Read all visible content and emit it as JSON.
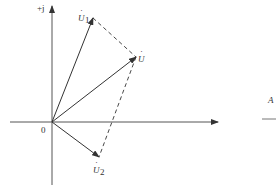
{
  "diagram": {
    "type": "phasor-diagram",
    "axis": {
      "imag_label": "+j",
      "origin_label": "0"
    },
    "phasors": [
      {
        "id": "U1",
        "label_base": "U",
        "label_sub": "1",
        "tip": [
          93,
          18
        ]
      },
      {
        "id": "U",
        "label_base": "U",
        "label_sub": "",
        "tip": [
          136,
          57
        ]
      },
      {
        "id": "U2",
        "label_base": "U",
        "label_sub": "2",
        "tip": [
          99,
          157
        ]
      }
    ],
    "parallelogram": "dashed lines from U1 tip to U tip and from U tip to U2 tip",
    "side_fragment": {
      "text": "A"
    }
  },
  "colors": {
    "line": "#333333",
    "background": "#ffffff"
  }
}
